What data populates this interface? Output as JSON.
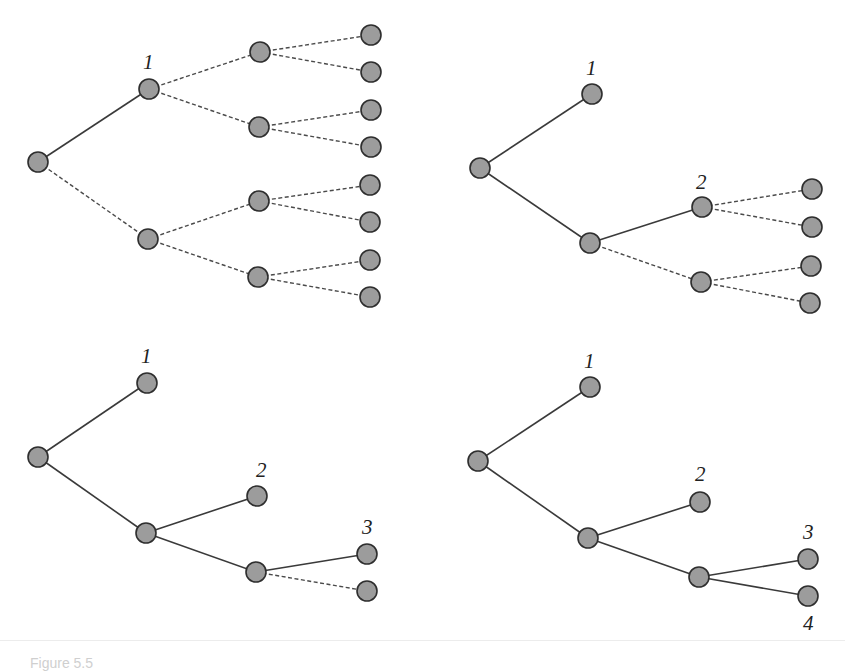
{
  "figure": {
    "caption_partial": "Figure 5.5",
    "node_radius": 10,
    "colors": {
      "node_fill": "#9c9c9c",
      "node_stroke": "#2e2e2e",
      "edge": "#3a3a3a",
      "label": "#222222"
    }
  },
  "panels": [
    {
      "id": "panel-1",
      "nodes": [
        {
          "x": 38,
          "y": 162
        },
        {
          "x": 149,
          "y": 89
        },
        {
          "x": 148,
          "y": 239
        },
        {
          "x": 260,
          "y": 52
        },
        {
          "x": 259,
          "y": 127
        },
        {
          "x": 259,
          "y": 201
        },
        {
          "x": 258,
          "y": 277
        },
        {
          "x": 371,
          "y": 35
        },
        {
          "x": 371,
          "y": 72
        },
        {
          "x": 371,
          "y": 110
        },
        {
          "x": 371,
          "y": 147
        },
        {
          "x": 370,
          "y": 185
        },
        {
          "x": 370,
          "y": 222
        },
        {
          "x": 370,
          "y": 260
        },
        {
          "x": 370,
          "y": 297
        }
      ],
      "edges": [
        {
          "from": 0,
          "to": 1,
          "style": "solid"
        },
        {
          "from": 0,
          "to": 2,
          "style": "dashed"
        },
        {
          "from": 1,
          "to": 3,
          "style": "dashed"
        },
        {
          "from": 1,
          "to": 4,
          "style": "dashed"
        },
        {
          "from": 2,
          "to": 5,
          "style": "dashed"
        },
        {
          "from": 2,
          "to": 6,
          "style": "dashed"
        },
        {
          "from": 3,
          "to": 7,
          "style": "dashed"
        },
        {
          "from": 3,
          "to": 8,
          "style": "dashed"
        },
        {
          "from": 4,
          "to": 9,
          "style": "dashed"
        },
        {
          "from": 4,
          "to": 10,
          "style": "dashed"
        },
        {
          "from": 5,
          "to": 11,
          "style": "dashed"
        },
        {
          "from": 5,
          "to": 12,
          "style": "dashed"
        },
        {
          "from": 6,
          "to": 13,
          "style": "dashed"
        },
        {
          "from": 6,
          "to": 14,
          "style": "dashed"
        }
      ],
      "labels": [
        {
          "text": "1",
          "x": 143,
          "y": 69
        }
      ]
    },
    {
      "id": "panel-2",
      "nodes": [
        {
          "x": 480,
          "y": 168
        },
        {
          "x": 592,
          "y": 94
        },
        {
          "x": 590,
          "y": 243
        },
        {
          "x": 702,
          "y": 207
        },
        {
          "x": 701,
          "y": 282
        },
        {
          "x": 812,
          "y": 189
        },
        {
          "x": 812,
          "y": 227
        },
        {
          "x": 811,
          "y": 266
        },
        {
          "x": 810,
          "y": 303
        }
      ],
      "edges": [
        {
          "from": 0,
          "to": 1,
          "style": "solid"
        },
        {
          "from": 0,
          "to": 2,
          "style": "solid"
        },
        {
          "from": 2,
          "to": 3,
          "style": "solid"
        },
        {
          "from": 2,
          "to": 4,
          "style": "dashed"
        },
        {
          "from": 3,
          "to": 5,
          "style": "dashed"
        },
        {
          "from": 3,
          "to": 6,
          "style": "dashed"
        },
        {
          "from": 4,
          "to": 7,
          "style": "dashed"
        },
        {
          "from": 4,
          "to": 8,
          "style": "dashed"
        }
      ],
      "labels": [
        {
          "text": "1",
          "x": 586,
          "y": 75
        },
        {
          "text": "2",
          "x": 696,
          "y": 189
        }
      ]
    },
    {
      "id": "panel-3",
      "nodes": [
        {
          "x": 38,
          "y": 457
        },
        {
          "x": 147,
          "y": 383
        },
        {
          "x": 146,
          "y": 533
        },
        {
          "x": 257,
          "y": 496
        },
        {
          "x": 256,
          "y": 572
        },
        {
          "x": 367,
          "y": 554
        },
        {
          "x": 367,
          "y": 591
        }
      ],
      "edges": [
        {
          "from": 0,
          "to": 1,
          "style": "solid"
        },
        {
          "from": 0,
          "to": 2,
          "style": "solid"
        },
        {
          "from": 2,
          "to": 3,
          "style": "solid"
        },
        {
          "from": 2,
          "to": 4,
          "style": "solid"
        },
        {
          "from": 4,
          "to": 5,
          "style": "solid"
        },
        {
          "from": 4,
          "to": 6,
          "style": "dashed"
        }
      ],
      "labels": [
        {
          "text": "1",
          "x": 141,
          "y": 363
        },
        {
          "text": "2",
          "x": 256,
          "y": 477
        },
        {
          "text": "3",
          "x": 362,
          "y": 534
        }
      ]
    },
    {
      "id": "panel-4",
      "nodes": [
        {
          "x": 478,
          "y": 461
        },
        {
          "x": 590,
          "y": 387
        },
        {
          "x": 588,
          "y": 538
        },
        {
          "x": 700,
          "y": 502
        },
        {
          "x": 699,
          "y": 577
        },
        {
          "x": 808,
          "y": 559
        },
        {
          "x": 808,
          "y": 596
        }
      ],
      "edges": [
        {
          "from": 0,
          "to": 1,
          "style": "solid"
        },
        {
          "from": 0,
          "to": 2,
          "style": "solid"
        },
        {
          "from": 2,
          "to": 3,
          "style": "solid"
        },
        {
          "from": 2,
          "to": 4,
          "style": "solid"
        },
        {
          "from": 4,
          "to": 5,
          "style": "solid"
        },
        {
          "from": 4,
          "to": 6,
          "style": "solid"
        }
      ],
      "labels": [
        {
          "text": "1",
          "x": 584,
          "y": 368
        },
        {
          "text": "2",
          "x": 695,
          "y": 481
        },
        {
          "text": "3",
          "x": 803,
          "y": 539
        },
        {
          "text": "4",
          "x": 803,
          "y": 630
        }
      ]
    }
  ]
}
